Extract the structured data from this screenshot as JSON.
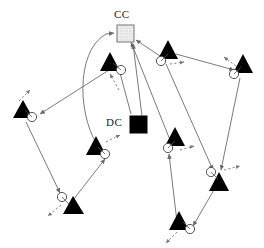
{
  "figure": {
    "type": "network-diagram",
    "background": "#ffffff",
    "width": 264,
    "height": 248,
    "stroke_color": "#6b6b6b",
    "node_fill": "#000000",
    "circle_stroke": "#555555",
    "dashed_color": "#777777"
  },
  "labels": {
    "cc": "CC",
    "dc": "DC"
  },
  "stations": [
    {
      "id": "cc",
      "name": "control-center",
      "label": "CC",
      "shape": "square",
      "fill": "#e6e6e6",
      "border": "#8a8a8a",
      "x": 117,
      "y": 25,
      "size": 17,
      "label_x": 117,
      "label_y": 10
    },
    {
      "id": "dc",
      "name": "data-center",
      "label": "DC",
      "shape": "square",
      "fill": "#000000",
      "border": "#000000",
      "x": 130,
      "y": 116,
      "size": 17,
      "label_x": 108,
      "label_y": 116
    }
  ],
  "nodes": [
    {
      "id": "n1",
      "name": "agent-node-upper-left",
      "tx": 110,
      "ty": 62,
      "cx": 121,
      "cy": 70,
      "dash_angle": 235
    },
    {
      "id": "n2",
      "name": "agent-node-left",
      "tx": 23,
      "ty": 110,
      "cx": 32,
      "cy": 117,
      "dash_angle": 65
    },
    {
      "id": "n3",
      "name": "agent-node-mid-left",
      "tx": 96,
      "ty": 146,
      "cx": 105,
      "cy": 154,
      "dash_angle": 35
    },
    {
      "id": "n4",
      "name": "agent-node-bottom-left",
      "tx": 71,
      "ty": 205,
      "cx": 62,
      "cy": 197,
      "dash_angle": 215
    },
    {
      "id": "n5",
      "name": "agent-node-upper-mid",
      "tx": 168,
      "ty": 50,
      "cx": 161,
      "cy": 61,
      "dash_angle": 10
    },
    {
      "id": "n6",
      "name": "agent-node-upper-right",
      "tx": 243,
      "ty": 64,
      "cx": 234,
      "cy": 74,
      "dash_angle": 200
    },
    {
      "id": "n7",
      "name": "agent-node-mid-right",
      "tx": 175,
      "ty": 137,
      "cx": 168,
      "cy": 148,
      "dash_angle": 25
    },
    {
      "id": "n8",
      "name": "agent-node-right-lower",
      "tx": 219,
      "ty": 182,
      "cx": 211,
      "cy": 172,
      "dash_angle": 15
    },
    {
      "id": "n9",
      "name": "agent-node-bottom-right",
      "tx": 179,
      "ty": 221,
      "cx": 190,
      "cy": 229,
      "dash_angle": 215
    },
    {
      "id": "n10",
      "name": "agent-node-bottom-mid",
      "tx": 0,
      "ty": 0,
      "cx": 0,
      "cy": 0,
      "dash_angle": 0
    }
  ],
  "edges": [
    {
      "name": "edge-n3-to-cc",
      "type": "curve",
      "from": "n3",
      "to": "cc",
      "arrow": "to"
    },
    {
      "name": "edge-n5-to-cc",
      "type": "line",
      "from": "n5",
      "to": "cc",
      "arrow": "to"
    },
    {
      "name": "edge-dc-to-cc",
      "type": "line",
      "from": "dc",
      "to": "cc",
      "arrow": "to"
    },
    {
      "name": "edge-n1-to-dc",
      "type": "line",
      "from": "n1",
      "to": "dc",
      "arrow": "to"
    },
    {
      "name": "edge-n1-to-n2",
      "type": "line",
      "from": "n1",
      "to": "n2",
      "arrow": "to"
    },
    {
      "name": "edge-n1-to-n3",
      "type": "line",
      "from": "n1",
      "to": "n3",
      "arrow": "none"
    },
    {
      "name": "edge-n2-to-n4",
      "type": "line",
      "from": "n2",
      "to": "n4",
      "arrow": "to"
    },
    {
      "name": "edge-n4-to-n3",
      "type": "line",
      "from": "n4",
      "to": "n3",
      "arrow": "to"
    },
    {
      "name": "edge-n5-to-n6",
      "type": "line",
      "from": "n5",
      "to": "n6",
      "arrow": "to"
    },
    {
      "name": "edge-n5-to-n8",
      "type": "line",
      "from": "n5",
      "to": "n8",
      "arrow": "to"
    },
    {
      "name": "edge-n6-to-n8",
      "type": "line",
      "from": "n6",
      "to": "n8",
      "arrow": "to"
    },
    {
      "name": "edge-n8-to-n9",
      "type": "line",
      "from": "n8",
      "to": "n9",
      "arrow": "to"
    },
    {
      "name": "edge-n9-to-n7",
      "type": "line",
      "from": "n9",
      "to": "n7",
      "arrow": "to"
    },
    {
      "name": "edge-n7-to-cc",
      "type": "line",
      "from": "n7",
      "to": "cc",
      "arrow": "to"
    }
  ]
}
